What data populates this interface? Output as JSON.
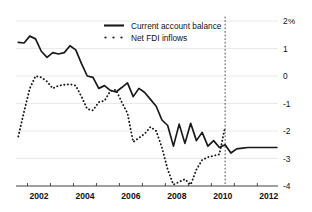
{
  "chart_data": {
    "type": "line",
    "title": "",
    "xlabel": "",
    "ylabel": "",
    "unit_label": "%",
    "xlim": [
      2001.5,
      2012.9
    ],
    "ylim": [
      -4,
      2
    ],
    "grid": true,
    "legend_position": "top-center",
    "x_ticks": [
      2002,
      2004,
      2006,
      2008,
      2010,
      2012
    ],
    "x_tick_labels": [
      "2002",
      "2004",
      "2006",
      "2008",
      "2010",
      "2012"
    ],
    "y_ticks": [
      2,
      1,
      0,
      -1,
      -2,
      -3,
      -4
    ],
    "y_tick_labels": [
      "2",
      "1",
      "0",
      "-1",
      "-2",
      "-3",
      "-4"
    ],
    "annotations": [
      {
        "name": "forecast-divider",
        "type": "vline",
        "x": 2010.6
      }
    ],
    "series": [
      {
        "name": "Current account balance",
        "style": "solid",
        "x": [
          2001.6,
          2001.85,
          2002.1,
          2002.35,
          2002.6,
          2002.85,
          2003.1,
          2003.35,
          2003.6,
          2003.85,
          2004.1,
          2004.35,
          2004.6,
          2004.85,
          2005.1,
          2005.35,
          2005.6,
          2005.85,
          2006.1,
          2006.35,
          2006.6,
          2006.85,
          2007.1,
          2007.35,
          2007.6,
          2007.85,
          2008.1,
          2008.35,
          2008.6,
          2008.85,
          2009.1,
          2009.35,
          2009.6,
          2009.85,
          2010.1,
          2010.35,
          2010.6,
          2010.85,
          2011.1,
          2011.35,
          2011.6,
          2011.85,
          2012.1,
          2012.35,
          2012.6,
          2012.85
        ],
        "values": [
          1.22,
          1.2,
          1.45,
          1.35,
          0.9,
          0.68,
          0.85,
          0.8,
          0.85,
          1.1,
          0.95,
          0.45,
          0.0,
          -0.05,
          -0.45,
          -0.35,
          -0.52,
          -0.58,
          -0.42,
          -0.25,
          -0.75,
          -0.45,
          -0.6,
          -0.85,
          -1.1,
          -1.6,
          -1.8,
          -2.55,
          -1.75,
          -2.45,
          -1.72,
          -2.35,
          -2.05,
          -2.55,
          -2.35,
          -2.6,
          -2.5,
          -2.8,
          -2.65,
          -2.62,
          -2.6,
          -2.6,
          -2.6,
          -2.6,
          -2.6,
          -2.6
        ]
      },
      {
        "name": "Net FDI inflows",
        "style": "dotted",
        "x": [
          2001.6,
          2001.85,
          2002.1,
          2002.35,
          2002.6,
          2002.85,
          2003.1,
          2003.35,
          2003.6,
          2003.85,
          2004.1,
          2004.35,
          2004.6,
          2004.85,
          2005.1,
          2005.35,
          2005.6,
          2005.85,
          2006.1,
          2006.35,
          2006.6,
          2006.85,
          2007.1,
          2007.35,
          2007.6,
          2007.85,
          2008.1,
          2008.35,
          2008.6,
          2008.85,
          2009.1,
          2009.35,
          2009.6,
          2009.85,
          2010.1,
          2010.35,
          2010.6
        ],
        "values": [
          -2.2,
          -1.3,
          -0.45,
          0.0,
          -0.05,
          -0.2,
          -0.45,
          -0.35,
          -0.32,
          -0.3,
          -0.35,
          -0.75,
          -1.2,
          -1.25,
          -0.95,
          -0.9,
          -0.55,
          -0.5,
          -0.95,
          -1.35,
          -2.4,
          -2.25,
          -2.1,
          -1.85,
          -2.0,
          -2.6,
          -3.4,
          -3.95,
          -3.85,
          -3.75,
          -3.95,
          -3.4,
          -3.05,
          -2.95,
          -2.9,
          -2.85,
          -1.85
        ]
      }
    ]
  },
  "legend": {
    "items": [
      {
        "label": "Current account balance",
        "style": "solid"
      },
      {
        "label": "Net FDI inflows",
        "style": "dotted"
      }
    ]
  }
}
